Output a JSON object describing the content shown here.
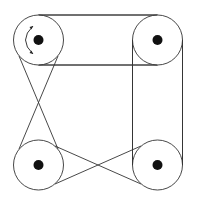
{
  "diagram": {
    "title": "",
    "type": "pulley-belt-system",
    "colors": {
      "stroke": "#333333",
      "hub": "#111111",
      "background": "#ffffff"
    },
    "pulleys": [
      {
        "id": "top-left",
        "cx": 38.5,
        "cy": 40,
        "r": 25,
        "hub_r": 5,
        "driver": true
      },
      {
        "id": "top-right",
        "cx": 157.5,
        "cy": 40,
        "r": 25,
        "hub_r": 5
      },
      {
        "id": "bottom-left",
        "cx": 38.5,
        "cy": 165,
        "r": 25,
        "hub_r": 5
      },
      {
        "id": "bottom-right",
        "cx": 157.5,
        "cy": 165,
        "r": 25,
        "hub_r": 5
      }
    ],
    "belts": [
      {
        "id": "top-open",
        "from": "top-left",
        "to": "top-right",
        "kind": "open"
      },
      {
        "id": "right-open",
        "from": "top-right",
        "to": "bottom-right",
        "kind": "open"
      },
      {
        "id": "left-crossed",
        "from": "top-left",
        "to": "bottom-left",
        "kind": "crossed"
      },
      {
        "id": "bottom-crossed",
        "from": "bottom-left",
        "to": "bottom-right",
        "kind": "crossed"
      }
    ],
    "annotations": [
      {
        "type": "rotation-arrow",
        "pulley": "top-left",
        "direction": "counterclockwise"
      }
    ]
  }
}
